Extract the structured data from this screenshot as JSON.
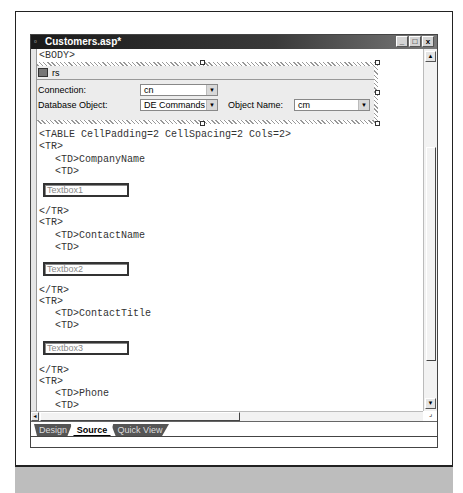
{
  "window": {
    "title": "Customers.asp*",
    "buttons": [
      "_",
      "□",
      "x"
    ]
  },
  "code": {
    "body_tag": "<BODY>",
    "table_tag": "<TABLE CellPadding=2 CellSpacing=2 Cols=2>",
    "rows": [
      {
        "tr": "<TR>",
        "td_label": "<TD>CompanyName",
        "td": "<TD>",
        "textbox": "Textbox1",
        "tr_close": "</TR>"
      },
      {
        "tr": "<TR>",
        "td_label": "<TD>ContactName",
        "td": "<TD>",
        "textbox": "Textbox2",
        "tr_close": "</TR>"
      },
      {
        "tr": "<TR>",
        "td_label": "<TD>ContactTitle",
        "td": "<TD>",
        "textbox": "Textbox3",
        "tr_close": "</TR>"
      },
      {
        "tr": "<TR>",
        "td_label": "<TD>Phone",
        "td": "<TD>",
        "textbox": "Textbox4"
      }
    ]
  },
  "recordset": {
    "name": "rs",
    "connection_label": "Connection:",
    "connection_value": "cn",
    "database_object_label": "Database Object:",
    "database_object_value": "DE Commands",
    "object_name_label": "Object Name:",
    "object_name_value": "cm"
  },
  "tabs": [
    {
      "label": "Design",
      "active": false
    },
    {
      "label": "Source",
      "active": true
    },
    {
      "label": "Quick View",
      "active": false
    }
  ],
  "icons": {
    "dropdown_arrow": "▼",
    "scroll_up": "▲",
    "scroll_down": "▼",
    "scroll_left": "◄",
    "resize_grip": "⌟"
  }
}
